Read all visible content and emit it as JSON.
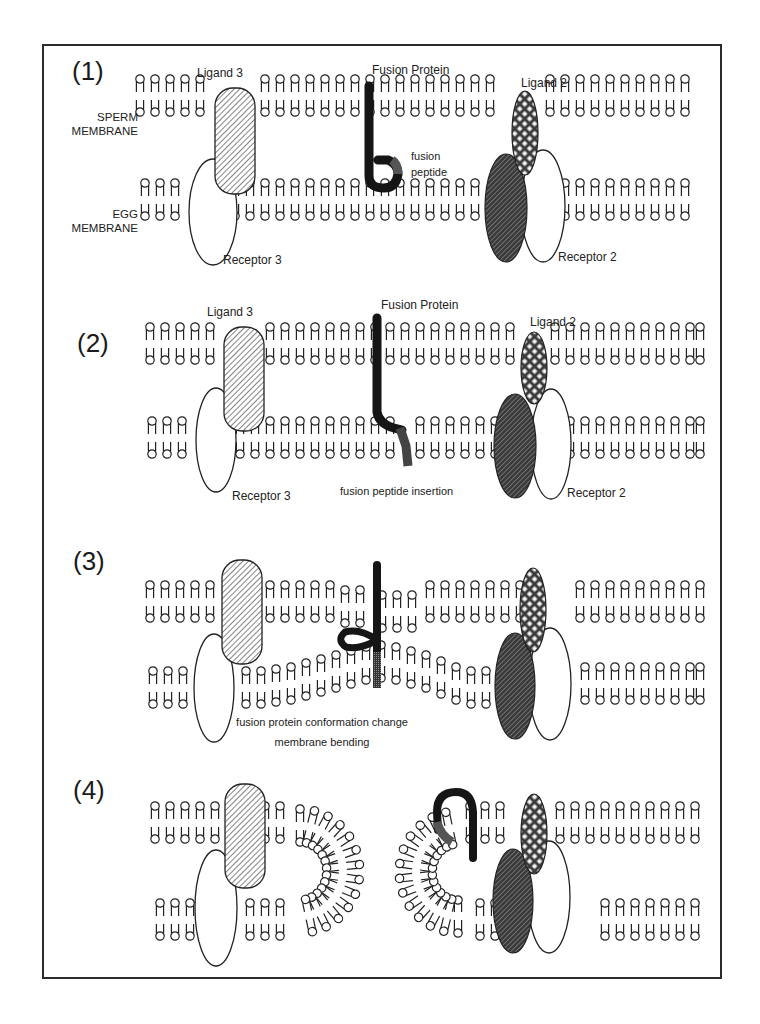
{
  "figure": {
    "panels": [
      {
        "id": "1",
        "step_label": "(1)",
        "labels": {
          "ligand3": "Ligand 3",
          "fusion_protein": "Fusion Protein",
          "ligand2": "Ligand 2",
          "sperm_membrane_1": "SPERM",
          "sperm_membrane_2": "MEMBRANE",
          "egg_membrane_1": "EGG",
          "egg_membrane_2": "MEMBRANE",
          "fusion_peptide_1": "fusion",
          "fusion_peptide_2": "peptide",
          "receptor3": "Receptor 3",
          "receptor2": "Receptor 2"
        }
      },
      {
        "id": "2",
        "step_label": "(2)",
        "labels": {
          "ligand3": "Ligand 3",
          "fusion_protein": "Fusion Protein",
          "ligand2": "Ligand 2",
          "receptor3": "Receptor 3",
          "caption": "fusion peptide insertion",
          "receptor2": "Receptor 2"
        }
      },
      {
        "id": "3",
        "step_label": "(3)",
        "labels": {
          "caption_1": "fusion protein conformation change",
          "caption_2": "membrane bending"
        }
      },
      {
        "id": "4",
        "step_label": "(4)",
        "labels": {}
      }
    ],
    "legend_semantics": {
      "ligand3": "diagonal-hatched rounded rectangle (sperm)",
      "ligand2": "cross-hatched ellipse (sperm)",
      "receptor3": "white ellipse (egg)",
      "receptor2": "white ellipse (egg)",
      "egg_partner": "dark hatched ellipse (egg)",
      "fusion_protein": "black tube with fusion peptide"
    },
    "colors": {
      "ink": "#1a1a1a",
      "frame": "#2b2b2b",
      "fusion_protein": "#151515",
      "fusion_peptide": "#555555",
      "dark_ellipse": "#2a2a2a",
      "background": "#ffffff"
    },
    "lipid_rows": [
      {
        "panel": "1",
        "membrane": "sperm",
        "y": 96,
        "xs": [
          140,
          155,
          170,
          185,
          200,
          265,
          280,
          295,
          310,
          325,
          340,
          355,
          370,
          385,
          400,
          415,
          430,
          445,
          460,
          475,
          490,
          550,
          565,
          580,
          595,
          610,
          625,
          640,
          655,
          670,
          685
        ]
      },
      {
        "panel": "1",
        "membrane": "egg",
        "y": 200,
        "xs": [
          145,
          160,
          175,
          235,
          250,
          265,
          280,
          295,
          310,
          325,
          340,
          355,
          370,
          385,
          400,
          415,
          430,
          445,
          460,
          475,
          565,
          580,
          595,
          610,
          625,
          640,
          655,
          670,
          685
        ]
      },
      {
        "panel": "2",
        "membrane": "sperm",
        "y": 344,
        "xs": [
          150,
          165,
          180,
          195,
          210,
          270,
          285,
          300,
          315,
          330,
          345,
          360,
          375,
          390,
          405,
          420,
          435,
          450,
          465,
          480,
          495,
          510,
          555,
          570,
          585,
          600,
          615,
          630,
          645,
          660,
          675,
          690,
          700
        ]
      },
      {
        "panel": "2",
        "membrane": "egg",
        "y": 438,
        "xs": [
          152,
          167,
          182,
          240,
          255,
          270,
          285,
          300,
          315,
          330,
          345,
          360,
          375,
          390,
          420,
          435,
          450,
          465,
          480,
          495,
          570,
          585,
          600,
          615,
          630,
          645,
          660,
          675,
          690,
          700
        ]
      }
    ]
  }
}
